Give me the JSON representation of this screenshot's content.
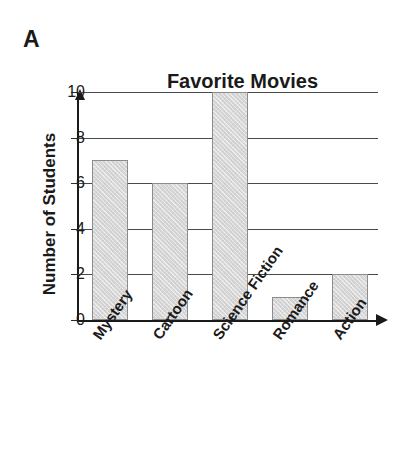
{
  "figure": {
    "panel_letter": "A"
  },
  "chart_data": {
    "type": "bar",
    "title": "Favorite Movies",
    "xlabel": "",
    "ylabel": "Number of Students",
    "categories": [
      "Mystery",
      "Cartoon",
      "Science Fiction",
      "Romance",
      "Action"
    ],
    "values": [
      7,
      6,
      10,
      1,
      2
    ],
    "ylim": [
      0,
      10
    ],
    "ytick_labels": [
      "0",
      "2",
      "4",
      "6",
      "8",
      "10"
    ],
    "ytick_values": [
      0,
      2,
      4,
      6,
      8,
      10
    ],
    "grid": "horizontal",
    "legend": "none",
    "bar_fill_color": "#d6d6d6",
    "bar_edge_color": "#8c8c8c",
    "axis_color": "#1a1a1a",
    "gridline_color": "#4a4a4a",
    "background_color": "#ffffff"
  }
}
